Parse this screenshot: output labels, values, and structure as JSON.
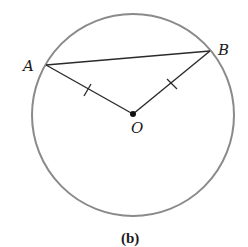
{
  "diagram": {
    "caption": "(b)",
    "circle": {
      "cx": 133,
      "cy": 115,
      "r": 101,
      "stroke": "#8a8a8a"
    },
    "points": {
      "A": {
        "label": "A",
        "x": 46,
        "y": 65
      },
      "B": {
        "label": "B",
        "x": 210,
        "y": 51
      },
      "O": {
        "label": "O",
        "x": 133,
        "y": 114
      }
    },
    "segments": [
      {
        "name": "chord-AB",
        "from": "A",
        "to": "B"
      },
      {
        "name": "radius-OA",
        "from": "O",
        "to": "A",
        "tick": true
      },
      {
        "name": "radius-OB",
        "from": "O",
        "to": "B",
        "tick": true
      }
    ],
    "line_color": "#2a2a2a"
  }
}
